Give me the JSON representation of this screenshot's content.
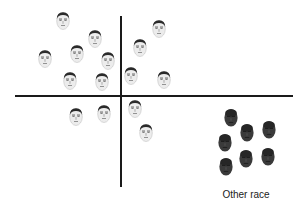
{
  "figure": {
    "width": 300,
    "height": 206,
    "axes": {
      "vertical": {
        "x": 121,
        "y1": 16,
        "y2": 187,
        "thickness": 2
      },
      "horizontal": {
        "y": 96,
        "x1": 15,
        "x2": 293,
        "thickness": 2
      }
    },
    "own_race_faces": [
      {
        "x": 63,
        "y": 20
      },
      {
        "x": 95,
        "y": 38
      },
      {
        "x": 45,
        "y": 58
      },
      {
        "x": 77,
        "y": 53
      },
      {
        "x": 108,
        "y": 60
      },
      {
        "x": 159,
        "y": 28
      },
      {
        "x": 140,
        "y": 47
      },
      {
        "x": 131,
        "y": 75
      },
      {
        "x": 164,
        "y": 79
      },
      {
        "x": 70,
        "y": 80
      },
      {
        "x": 102,
        "y": 81
      },
      {
        "x": 76,
        "y": 116
      },
      {
        "x": 104,
        "y": 113
      },
      {
        "x": 135,
        "y": 108
      },
      {
        "x": 146,
        "y": 132
      }
    ],
    "other_race_faces": [
      {
        "x": 231,
        "y": 117
      },
      {
        "x": 247,
        "y": 132
      },
      {
        "x": 269,
        "y": 129
      },
      {
        "x": 225,
        "y": 142
      },
      {
        "x": 246,
        "y": 158
      },
      {
        "x": 268,
        "y": 156
      },
      {
        "x": 226,
        "y": 166
      }
    ],
    "other_race_label": {
      "text": "Other race",
      "x": 246,
      "y": 189
    },
    "colors": {
      "axis": "#1a1a1a",
      "own_face_skin": "#ececec",
      "own_face_hair": "#2a2a2a",
      "other_face_skin": "#3a3a3a",
      "label": "#222222"
    }
  }
}
